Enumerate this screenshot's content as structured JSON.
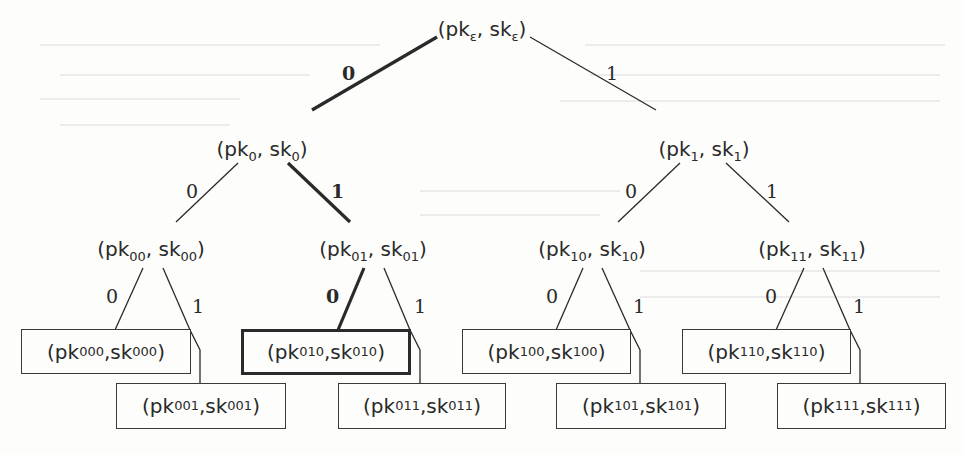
{
  "diagram": {
    "type": "binary-key-tree",
    "highlighted_path": [
      "ε",
      "0",
      "01",
      "010"
    ],
    "root": {
      "pk": "pk",
      "sk": "sk",
      "index": "ε"
    },
    "level1": [
      {
        "index": "0"
      },
      {
        "index": "1"
      }
    ],
    "level2": [
      {
        "index": "00"
      },
      {
        "index": "01"
      },
      {
        "index": "10"
      },
      {
        "index": "11"
      }
    ],
    "leaves": [
      {
        "index": "000",
        "highlighted": false
      },
      {
        "index": "001",
        "highlighted": false
      },
      {
        "index": "010",
        "highlighted": true
      },
      {
        "index": "011",
        "highlighted": false
      },
      {
        "index": "100",
        "highlighted": false
      },
      {
        "index": "101",
        "highlighted": false
      },
      {
        "index": "110",
        "highlighted": false
      },
      {
        "index": "111",
        "highlighted": false
      }
    ],
    "edge_labels": {
      "zero": "0",
      "one": "1"
    },
    "text": {
      "open": "(",
      "pk": "pk",
      "comma": ", ",
      "sk": "sk",
      "close": ")"
    },
    "colors": {
      "line": "#2a2a2a",
      "background": "#fdfdfb"
    }
  }
}
